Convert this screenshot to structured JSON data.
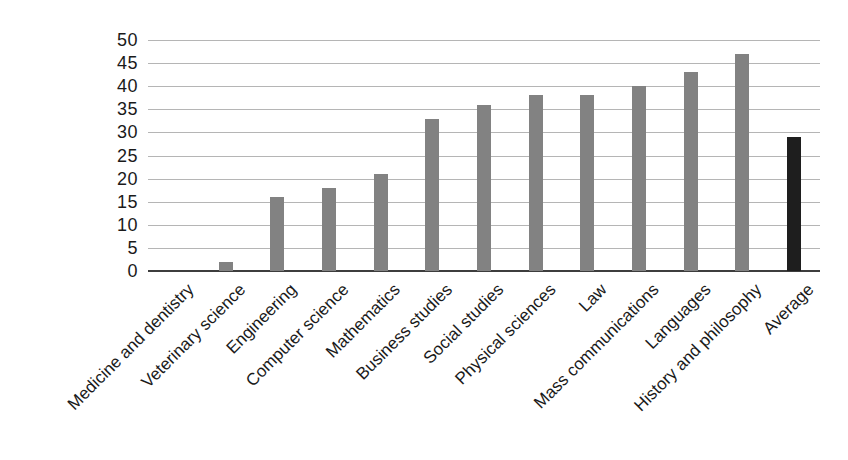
{
  "chart_data": {
    "type": "bar",
    "title": "",
    "xlabel": "",
    "ylabel": "",
    "categories": [
      "Medicine and dentistry",
      "Veterinary science",
      "Engineering",
      "Computer science",
      "Mathematics",
      "Business studies",
      "Social studies",
      "Physical sciences",
      "Law",
      "Mass communications",
      "Languages",
      "History and philosophy",
      "Average"
    ],
    "values": [
      0,
      2,
      16,
      18,
      21,
      33,
      36,
      38,
      38,
      40,
      43,
      47,
      29
    ],
    "highlight_index": 12,
    "ylim": [
      0,
      50
    ],
    "ytick_step": 5,
    "ytick_labels": [
      "0",
      "5",
      "10",
      "15",
      "20",
      "25",
      "30",
      "35",
      "40",
      "45",
      "50"
    ],
    "grid": true,
    "legend_position": "none",
    "colors": {
      "bar": "#828282",
      "highlight_bar": "#1e1e1e",
      "gridline": "#b5b5b5",
      "axis": "#3d3d3d",
      "text": "#1a1a1a"
    }
  }
}
